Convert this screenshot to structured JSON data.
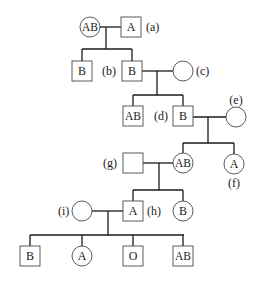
{
  "diagram": {
    "type": "pedigree",
    "colors": {
      "line": "#1a1a1a",
      "shape_stroke": "#4a4a4a",
      "background": "#ffffff"
    },
    "individuals": [
      {
        "id": "g1-f",
        "shape": "circle",
        "blood_type": "AB",
        "label": "",
        "cx": 90,
        "cy": 27
      },
      {
        "id": "a",
        "shape": "square",
        "blood_type": "A",
        "label": "(a)",
        "cx": 131,
        "cy": 27
      },
      {
        "id": "g2-m1",
        "shape": "square",
        "blood_type": "B",
        "label": "",
        "cx": 82,
        "cy": 71
      },
      {
        "id": "b",
        "shape": "square",
        "blood_type": "B",
        "label": "(b)",
        "cx": 132,
        "cy": 71
      },
      {
        "id": "c",
        "shape": "circle",
        "blood_type": "",
        "label": "(c)",
        "cx": 183,
        "cy": 71
      },
      {
        "id": "g3-m1",
        "shape": "square",
        "blood_type": "AB",
        "label": "",
        "cx": 133,
        "cy": 116
      },
      {
        "id": "d",
        "shape": "square",
        "blood_type": "B",
        "label": "(d)",
        "cx": 183,
        "cy": 116
      },
      {
        "id": "e",
        "shape": "circle",
        "blood_type": "",
        "label": "(e)",
        "cx": 236,
        "cy": 117
      },
      {
        "id": "g",
        "shape": "square",
        "blood_type": "",
        "label": "(g)",
        "cx": 133,
        "cy": 163
      },
      {
        "id": "g4-f1",
        "shape": "circle",
        "blood_type": "AB",
        "label": "",
        "cx": 183,
        "cy": 163
      },
      {
        "id": "f",
        "shape": "circle",
        "blood_type": "A",
        "label": "(f)",
        "cx": 234,
        "cy": 164
      },
      {
        "id": "i",
        "shape": "circle",
        "blood_type": "",
        "label": "(i)",
        "cx": 82,
        "cy": 211
      },
      {
        "id": "h",
        "shape": "square",
        "blood_type": "A",
        "label": "(h)",
        "cx": 133,
        "cy": 211
      },
      {
        "id": "g5-f1",
        "shape": "circle",
        "blood_type": "B",
        "label": "",
        "cx": 183,
        "cy": 211
      },
      {
        "id": "g6-m1",
        "shape": "square",
        "blood_type": "B",
        "label": "",
        "cx": 30,
        "cy": 256
      },
      {
        "id": "g6-f1",
        "shape": "circle",
        "blood_type": "A",
        "label": "",
        "cx": 82,
        "cy": 256
      },
      {
        "id": "g6-m2",
        "shape": "square",
        "blood_type": "O",
        "label": "",
        "cx": 133,
        "cy": 256
      },
      {
        "id": "g6-m3",
        "shape": "square",
        "blood_type": "AB",
        "label": "",
        "cx": 183,
        "cy": 256
      }
    ],
    "labels": [
      {
        "for": "a",
        "text": "(a)",
        "x": 146,
        "y": 31,
        "anchor": "start"
      },
      {
        "for": "b",
        "text": "(b)",
        "x": 102,
        "y": 75,
        "anchor": "start"
      },
      {
        "for": "c",
        "text": "(c)",
        "x": 196,
        "y": 75,
        "anchor": "start"
      },
      {
        "for": "d",
        "text": "(d)",
        "x": 154,
        "y": 120,
        "anchor": "start"
      },
      {
        "for": "e",
        "text": "(e)",
        "x": 236,
        "y": 104,
        "anchor": "middle"
      },
      {
        "for": "g",
        "text": "(g)",
        "x": 103,
        "y": 167,
        "anchor": "start"
      },
      {
        "for": "f",
        "text": "(f)",
        "x": 234,
        "y": 187,
        "anchor": "middle"
      },
      {
        "for": "i",
        "text": "(i)",
        "x": 58,
        "y": 215,
        "anchor": "start"
      },
      {
        "for": "h",
        "text": "(h)",
        "x": 147,
        "y": 215,
        "anchor": "start"
      }
    ],
    "lines": [
      [
        99,
        27,
        123,
        27
      ],
      [
        106,
        27,
        106,
        49
      ],
      [
        82,
        49,
        132,
        49
      ],
      [
        82,
        49,
        82,
        62
      ],
      [
        132,
        49,
        132,
        62
      ],
      [
        141,
        71,
        173,
        71
      ],
      [
        157,
        71,
        157,
        95
      ],
      [
        133,
        95,
        183,
        95
      ],
      [
        133,
        95,
        133,
        106
      ],
      [
        183,
        95,
        183,
        106
      ],
      [
        192,
        117,
        226,
        117
      ],
      [
        208,
        117,
        208,
        143
      ],
      [
        183,
        143,
        234,
        143
      ],
      [
        183,
        143,
        183,
        153
      ],
      [
        234,
        143,
        234,
        154
      ],
      [
        143,
        163,
        173,
        163
      ],
      [
        159,
        163,
        159,
        190
      ],
      [
        133,
        190,
        183,
        190
      ],
      [
        133,
        190,
        133,
        202
      ],
      [
        183,
        190,
        183,
        201
      ],
      [
        92,
        211,
        123,
        211
      ],
      [
        108,
        211,
        108,
        235
      ],
      [
        30,
        235,
        184,
        235
      ],
      [
        30,
        235,
        30,
        246
      ],
      [
        82,
        235,
        82,
        246
      ],
      [
        133,
        235,
        133,
        246
      ],
      [
        183,
        235,
        183,
        246
      ]
    ],
    "sizes": {
      "square_half": 10,
      "circle_r": 10
    }
  }
}
